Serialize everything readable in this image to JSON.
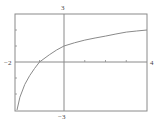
{
  "chart_data": {
    "type": "line",
    "title": "",
    "xlabel": "",
    "ylabel": "",
    "xlim": [
      -2,
      4
    ],
    "ylim": [
      -3,
      3
    ],
    "grid": false,
    "legend": null,
    "tick_labels": {
      "x_min": "−2",
      "x_max": "4",
      "y_max": "3",
      "y_min": "−3"
    },
    "x_ticks": [
      -1,
      0,
      1,
      2,
      3
    ],
    "y_ticks": [
      -2,
      -1,
      1,
      2
    ],
    "series": [
      {
        "name": "curve",
        "color": "#8a8a8a",
        "x": [
          -1.92,
          -1.8,
          -1.6,
          -1.4,
          -1.2,
          -1.0,
          -0.6,
          -0.3,
          0,
          0.5,
          1,
          1.5,
          2,
          2.5,
          3,
          3.5,
          4
        ],
        "y": [
          -3.0,
          -2.2,
          -1.4,
          -0.85,
          -0.4,
          0.0,
          0.45,
          0.75,
          1.0,
          1.2,
          1.37,
          1.5,
          1.62,
          1.75,
          1.87,
          1.94,
          2.0
        ]
      }
    ]
  },
  "colors": {
    "frame": "#8a8a8a",
    "axis": "#8a8a8a",
    "curve": "#8a8a8a",
    "label": "#444444"
  }
}
